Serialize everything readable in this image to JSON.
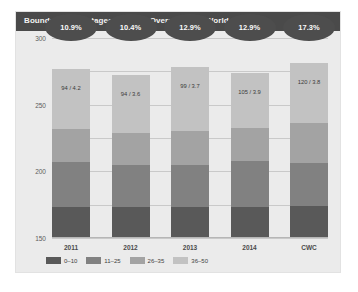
{
  "header": {
    "title": "Boundary percentages in Death Overs at each World Cup"
  },
  "badges": [
    {
      "label": "10.9%"
    },
    {
      "label": "10.4%"
    },
    {
      "label": "12.9%"
    },
    {
      "label": "12.9%"
    },
    {
      "label": "17.3%"
    }
  ],
  "bar_labels": [
    {
      "text": "94 / 4.2"
    },
    {
      "text": "94 / 3.6"
    },
    {
      "text": "99 / 3.7"
    },
    {
      "text": "105 / 3.9"
    },
    {
      "text": "120 / 3.8"
    }
  ],
  "legend": [
    {
      "label": "0–10",
      "color": "#595959"
    },
    {
      "label": "11–25",
      "color": "#818181"
    },
    {
      "label": "26–35",
      "color": "#a3a3a3"
    },
    {
      "label": "36–50",
      "color": "#c2c2c2"
    }
  ],
  "yticks": [
    {
      "label": "300",
      "value": 300
    },
    {
      "label": "250",
      "value": 250
    },
    {
      "label": "200",
      "value": 200
    },
    {
      "label": "150",
      "value": 150
    },
    {
      "label": "100",
      "value": 100
    },
    {
      "label": "50",
      "value": 50
    },
    {
      "label": "0",
      "value": 0
    }
  ],
  "xticks": [
    {
      "label": "2011"
    },
    {
      "label": "2012"
    },
    {
      "label": "2013"
    },
    {
      "label": "2014"
    },
    {
      "label": "CWC"
    }
  ],
  "chart_data": {
    "type": "bar",
    "stacked": true,
    "title": "Boundary percentages in Death Overs at each World Cup",
    "xlabel": "",
    "ylabel": "",
    "ylim": [
      0,
      300
    ],
    "ytick_step": 50,
    "grid": true,
    "legend_position": "bottom-left",
    "categories": [
      "2011",
      "2012",
      "2013",
      "2014",
      "CWC"
    ],
    "series": [
      {
        "name": "0–10",
        "color": "#595959",
        "values": [
          47,
          47,
          46,
          47,
          48
        ]
      },
      {
        "name": "11–25",
        "color": "#818181",
        "values": [
          67,
          63,
          64,
          68,
          65
        ]
      },
      {
        "name": "26–35",
        "color": "#a3a3a3",
        "values": [
          50,
          48,
          50,
          50,
          59
        ]
      },
      {
        "name": "36–50",
        "color": "#c2c2c2",
        "values": [
          89,
          87,
          97,
          82,
          90
        ]
      }
    ],
    "totals": [
      253,
      245,
      257,
      247,
      262
    ],
    "annotations": {
      "badges": [
        "10.9%",
        "10.4%",
        "12.9%",
        "12.9%",
        "17.3%"
      ],
      "in_bar": [
        "94 / 4.2",
        "94 / 3.6",
        "99 / 3.7",
        "105 / 3.9",
        "120 / 3.8"
      ]
    }
  }
}
